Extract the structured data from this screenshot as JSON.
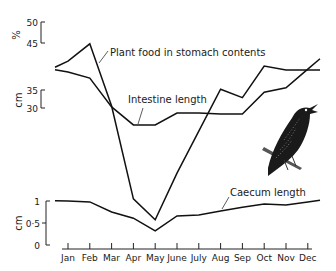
{
  "chart_data": {
    "type": "line",
    "title": "",
    "categories": [
      "Jan",
      "Feb",
      "Mar",
      "Apr",
      "May",
      "June",
      "July",
      "Aug",
      "Sep",
      "Oct",
      "Nov",
      "Dec"
    ],
    "series": [
      {
        "name": "Plant food in stomach contents",
        "unit": "%",
        "axis": "percent",
        "values": [
          40.7,
          44.8,
          30,
          7.9,
          2.9,
          14,
          24,
          34,
          32,
          39.5,
          38.6,
          38.6
        ]
      },
      {
        "name": "Intestine length",
        "unit": "cm",
        "axis": "intestine",
        "values": [
          40,
          38.3,
          30.3,
          25.3,
          25.3,
          28.6,
          28.6,
          28.3,
          28.3,
          34.4,
          35.6,
          40.8
        ]
      },
      {
        "name": "Caecum length",
        "unit": "cm",
        "axis": "caecum",
        "values": [
          1.0,
          0.98,
          0.75,
          0.61,
          0.32,
          0.66,
          0.68,
          0.77,
          0.86,
          0.93,
          0.91,
          0.98
        ]
      }
    ],
    "axes": {
      "percent": {
        "label": "%",
        "ticks": [
          "50",
          "45"
        ],
        "tick_values": [
          50,
          45
        ]
      },
      "intestine": {
        "label": "cm",
        "ticks": [
          "35",
          "30"
        ],
        "tick_values": [
          35,
          30
        ]
      },
      "caecum": {
        "label": "cm",
        "ticks": [
          "1",
          "0·5",
          "0"
        ],
        "tick_values": [
          1,
          0.5,
          0
        ],
        "ylim": [
          0,
          1
        ]
      }
    },
    "xlabel": "",
    "legend": "inline labels with leader lines",
    "grid": false,
    "annotations": [
      "Illustration of a starling perched on a branch"
    ]
  },
  "labels": {
    "plant_food": "Plant food in stomach contents",
    "intestine": "Intestine length",
    "caecum": "Caecum length"
  },
  "illustration": "starling-bird"
}
